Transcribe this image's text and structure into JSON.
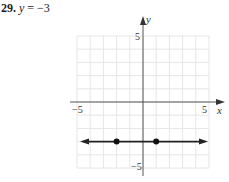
{
  "problem": {
    "number": "29.",
    "variable": "y",
    "equation_rest": " = −3"
  },
  "axes": {
    "x_label": "x",
    "y_label": "y",
    "x_min_label": "−5",
    "x_max_label": "5",
    "y_max_label": "5",
    "y_min_label": "−5"
  },
  "colors": {
    "grid": "#e6e6e6",
    "axis": "#555555",
    "line": "#222222",
    "point": "#111111"
  },
  "chart_data": {
    "type": "line",
    "title": "29. y = −3",
    "xlabel": "x",
    "ylabel": "y",
    "xlim": [
      -5,
      5
    ],
    "ylim": [
      -5,
      5
    ],
    "grid": true,
    "x_ticks_labeled": [
      -5,
      5
    ],
    "y_ticks_labeled": [
      -5,
      5
    ],
    "series": [
      {
        "name": "y = -3",
        "kind": "horizontal line with arrows at both ends",
        "x": [
          -5,
          5
        ],
        "y": [
          -3,
          -3
        ]
      }
    ],
    "points": [
      {
        "x": -2,
        "y": -3
      },
      {
        "x": 1,
        "y": -3
      }
    ],
    "legend": null
  }
}
